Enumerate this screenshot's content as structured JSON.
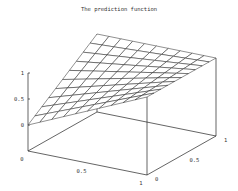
{
  "chart_data": {
    "type": "surface",
    "title": "The prediction function",
    "xlabel": "",
    "ylabel": "",
    "zlabel": "",
    "x_ticks": [
      "0",
      "0.5",
      "1"
    ],
    "y_ticks": [
      "0",
      "0.5",
      "1"
    ],
    "z_ticks": [
      "0",
      "0.5",
      "1"
    ],
    "xlim": [
      0,
      1
    ],
    "ylim": [
      0,
      1
    ],
    "zlim": [
      0,
      1
    ],
    "grid_n": 10,
    "surface": "z = x + y - x*y",
    "corners": [
      {
        "x": 0,
        "y": 0,
        "z": 0
      },
      {
        "x": 1,
        "y": 0,
        "z": 1
      },
      {
        "x": 0,
        "y": 1,
        "z": 1
      },
      {
        "x": 1,
        "y": 1,
        "z": 1
      }
    ]
  }
}
